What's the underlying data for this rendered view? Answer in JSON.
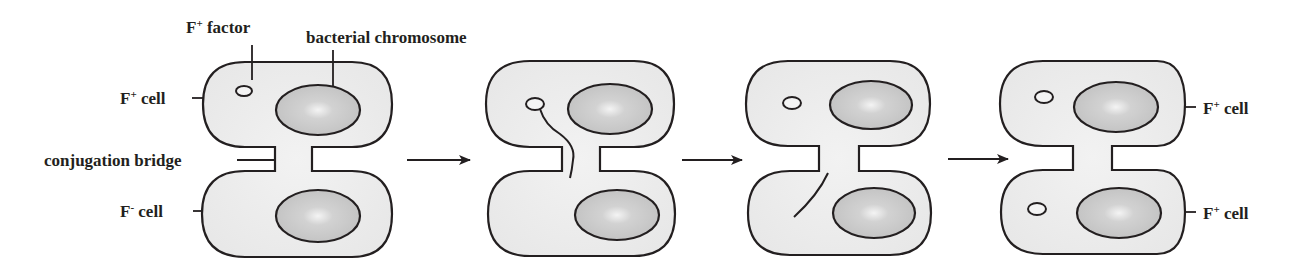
{
  "diagram": {
    "labels": {
      "f_factor": "F",
      "f_factor_sup": "+",
      "f_factor_rest": " factor",
      "chromosome": "bacterial chromosome",
      "f_plus_cell_sym": "F",
      "f_plus_sup": "+",
      "f_minus_sup": "-",
      "cell_word": " cell",
      "bridge": "conjugation bridge"
    },
    "stages": [
      {
        "id": 1,
        "description": "F+ cell connected to F- cell by conjugation bridge"
      },
      {
        "id": 2,
        "description": "F factor strand passes through bridge"
      },
      {
        "id": 3,
        "description": "Strand arrives in recipient cell"
      },
      {
        "id": 4,
        "description": "Both cells are F+ cells"
      }
    ],
    "colors": {
      "cell_fill": "#eeeeee",
      "chromosome_fill": "#c8c8c8",
      "outline": "#231f20",
      "background": "#ffffff"
    }
  }
}
